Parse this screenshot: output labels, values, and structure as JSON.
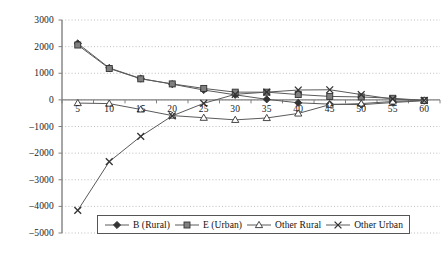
{
  "chart_data": {
    "type": "line",
    "title": "",
    "xlabel": "",
    "ylabel": "",
    "categories": [
      5,
      10,
      15,
      20,
      25,
      30,
      35,
      40,
      45,
      50,
      55,
      60
    ],
    "x_tick_labels": [
      "5",
      "10",
      "15",
      "20",
      "25",
      "30",
      "35",
      "40",
      "45",
      "50",
      "55",
      "60"
    ],
    "y_tick_labels": [
      "3000",
      "2000",
      "1000",
      "0",
      "-1000",
      "-2000",
      "-3000",
      "-4000",
      "-5000"
    ],
    "y_ticks": [
      3000,
      2000,
      1000,
      0,
      -1000,
      -2000,
      -3000,
      -4000,
      -5000
    ],
    "ylim": [
      -5000,
      3000
    ],
    "y_step": 1000,
    "grid": "horizontal-dotted",
    "legend_position": "bottom",
    "axis_crosses_at": 0,
    "series": [
      {
        "name": "B (Rural)",
        "marker": "diamond",
        "color": "#4a4a4a",
        "values": [
          2120,
          1200,
          800,
          590,
          370,
          190,
          20,
          -110,
          -160,
          -180,
          -100,
          -30
        ]
      },
      {
        "name": "E (Urban)",
        "marker": "square",
        "color": "#4a4a4a",
        "values": [
          2060,
          1180,
          790,
          600,
          430,
          290,
          290,
          200,
          130,
          110,
          60,
          -20
        ]
      },
      {
        "name": "Other Rural",
        "marker": "triangle",
        "color": "#4a4a4a",
        "values": [
          -120,
          -140,
          -360,
          -590,
          -670,
          -750,
          -680,
          -510,
          -180,
          -140,
          -60,
          -20
        ]
      },
      {
        "name": "Other Urban",
        "marker": "cross",
        "color": "#4a4a4a",
        "values": [
          -4150,
          -2320,
          -1370,
          -600,
          -130,
          210,
          290,
          370,
          380,
          200,
          30,
          -20
        ]
      }
    ]
  },
  "legend": {
    "items": [
      {
        "label": "B (Rural)",
        "marker": "diamond"
      },
      {
        "label": "E (Urban)",
        "marker": "square"
      },
      {
        "label": "Other Rural",
        "marker": "triangle"
      },
      {
        "label": "Other Urban",
        "marker": "cross"
      }
    ]
  },
  "colors": {
    "line": "#5a5a5a",
    "marker_fill": "#808080",
    "marker_stroke": "#333333",
    "grid": "#bdbdbd",
    "axis": "#808080",
    "text": "#1a1a1a",
    "background": "#ffffff"
  }
}
